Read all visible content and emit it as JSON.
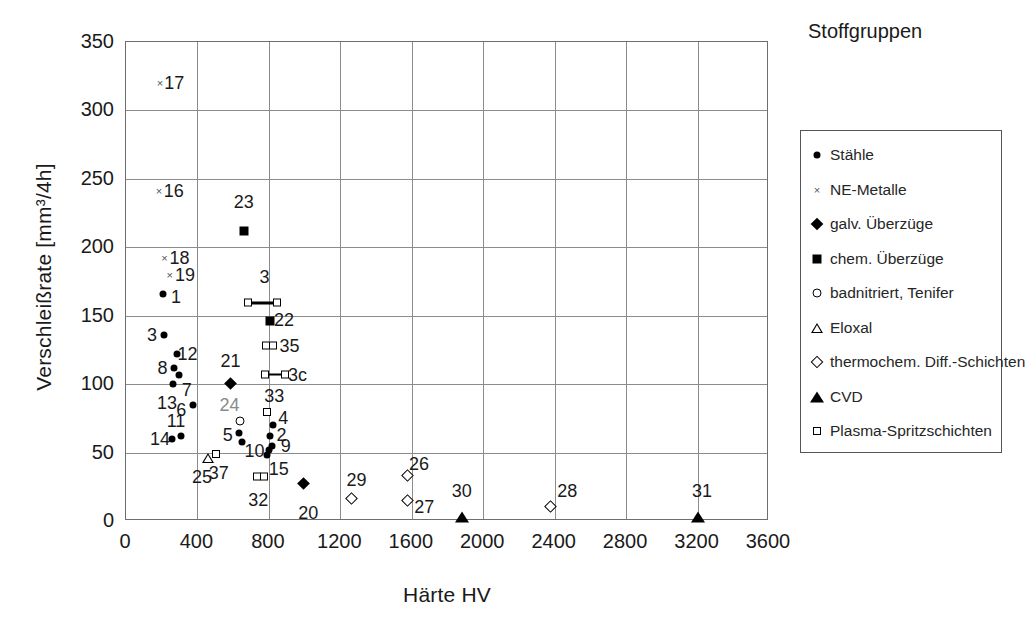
{
  "chart_data": {
    "type": "scatter",
    "title": "",
    "xlabel": "Härte HV",
    "ylabel": "Verschleißrate [mm³/4h]",
    "xlim": [
      0,
      3600
    ],
    "ylim": [
      0,
      350
    ],
    "xticks": [
      0,
      400,
      800,
      1200,
      1600,
      2000,
      2400,
      2800,
      3200,
      3600
    ],
    "yticks": [
      0,
      50,
      100,
      150,
      200,
      250,
      300,
      350
    ],
    "grid": true,
    "legend_title": "Stoffgruppen",
    "legend_position": "right",
    "series": [
      {
        "name": "Stähle",
        "marker": "circle-filled"
      },
      {
        "name": "NE-Metalle",
        "marker": "cross"
      },
      {
        "name": "galv. Überzüge",
        "marker": "diamond-filled"
      },
      {
        "name": "chem. Überzüge",
        "marker": "square-filled"
      },
      {
        "name": "badnitriert, Tenifer",
        "marker": "circle-open"
      },
      {
        "name": "Eloxal",
        "marker": "triangle-open"
      },
      {
        "name": "thermochem. Diff.-Schichten",
        "marker": "diamond-open"
      },
      {
        "name": "CVD",
        "marker": "triangle-filled"
      },
      {
        "name": "Plasma-Spritzschichten",
        "marker": "square-open"
      }
    ],
    "points": [
      {
        "label": "17",
        "series": "NE-Metalle",
        "x": 190,
        "y": 320,
        "lx": 270,
        "ly": 320
      },
      {
        "label": "16",
        "series": "NE-Metalle",
        "x": 185,
        "y": 241,
        "lx": 268,
        "ly": 241
      },
      {
        "label": "23",
        "series": "chem. Überzüge",
        "x": 660,
        "y": 212,
        "lx": 660,
        "ly": 233
      },
      {
        "label": "18",
        "series": "NE-Metalle",
        "x": 215,
        "y": 192,
        "lx": 300,
        "ly": 192
      },
      {
        "label": "19",
        "series": "NE-Metalle",
        "x": 245,
        "y": 180,
        "lx": 330,
        "ly": 180
      },
      {
        "label": "1",
        "series": "Stähle",
        "x": 205,
        "y": 166,
        "lx": 280,
        "ly": 164
      },
      {
        "label": "3",
        "series": "Plasma-Spritzschichten",
        "x": 765,
        "y": 159,
        "x0": 660,
        "x1": 870,
        "lx": 775,
        "ly": 178,
        "range": true
      },
      {
        "label": "22",
        "series": "chem. Überzüge",
        "x": 805,
        "y": 146,
        "lx": 885,
        "ly": 147
      },
      {
        "label": "3b",
        "series": "Stähle",
        "x": 215,
        "y": 136,
        "lx": 145,
        "ly": 136,
        "dl": "3"
      },
      {
        "label": "35",
        "series": "Plasma-Spritzschichten",
        "x": 800,
        "y": 128,
        "x0": 760,
        "x1": 845,
        "lx": 915,
        "ly": 128,
        "range": true
      },
      {
        "label": "12",
        "series": "Stähle",
        "x": 285,
        "y": 122,
        "lx": 345,
        "ly": 122
      },
      {
        "label": "3c",
        "series": "Plasma-Spritzschichten",
        "x": 830,
        "y": 107,
        "x0": 755,
        "x1": 915,
        "lx": 960,
        "ly": 107,
        "range": true
      },
      {
        "label": "8",
        "series": "Stähle",
        "x": 270,
        "y": 112,
        "lx": 205,
        "ly": 112
      },
      {
        "label": "7",
        "series": "Stähle",
        "x": 295,
        "y": 107,
        "lx": 340,
        "ly": 96
      },
      {
        "label": "21",
        "series": "galv. Überzüge",
        "x": 610,
        "y": 97,
        "lx": 585,
        "ly": 117
      },
      {
        "label": "13",
        "series": "Stähle",
        "x": 265,
        "y": 100,
        "lx": 230,
        "ly": 86
      },
      {
        "label": "6",
        "series": "Stähle",
        "x": 375,
        "y": 85,
        "lx": 310,
        "ly": 81
      },
      {
        "label": "24",
        "series": "badnitriert, Tenifer",
        "x": 640,
        "y": 73,
        "lx": 580,
        "ly": 85,
        "gray": true
      },
      {
        "label": "33",
        "series": "Plasma-Spritzschichten",
        "x": 790,
        "y": 80,
        "lx": 830,
        "ly": 91
      },
      {
        "label": "4",
        "series": "Stähle",
        "x": 825,
        "y": 70,
        "lx": 880,
        "ly": 75
      },
      {
        "label": "2",
        "series": "Stähle",
        "x": 805,
        "y": 62,
        "lx": 870,
        "ly": 63
      },
      {
        "label": "11",
        "series": "Stähle",
        "x": 310,
        "y": 62,
        "lx": 280,
        "ly": 73
      },
      {
        "label": "5",
        "series": "Stähle",
        "x": 635,
        "y": 64,
        "lx": 570,
        "ly": 63
      },
      {
        "label": "5b",
        "series": "Stähle",
        "x": 650,
        "y": 58,
        "lx": 0,
        "ly": 0,
        "nolabel": true
      },
      {
        "label": "14",
        "series": "Stähle",
        "x": 255,
        "y": 60,
        "lx": 190,
        "ly": 60
      },
      {
        "label": "9",
        "series": "Stähle",
        "x": 820,
        "y": 55,
        "lx": 895,
        "ly": 55
      },
      {
        "label": "10",
        "series": "Stähle",
        "x": 790,
        "y": 48,
        "lx": 720,
        "ly": 51
      },
      {
        "label": "37",
        "series": "Plasma-Spritzschichten",
        "x": 505,
        "y": 49,
        "lx": 520,
        "ly": 35
      },
      {
        "label": "25",
        "series": "Eloxal",
        "x": 460,
        "y": 46,
        "lx": 425,
        "ly": 32
      },
      {
        "label": "15",
        "series": "Stähle",
        "x": 800,
        "y": 52,
        "lx": 855,
        "ly": 38
      },
      {
        "label": "32",
        "series": "Plasma-Spritzschichten",
        "x": 755,
        "y": 32,
        "x0": 710,
        "x1": 795,
        "lx": 740,
        "ly": 15,
        "range": true
      },
      {
        "label": "20",
        "series": "galv. Überzüge",
        "x": 1020,
        "y": 24,
        "lx": 1020,
        "ly": 6
      },
      {
        "label": "29",
        "series": "thermochem. Diff.-Schichten",
        "x": 1290,
        "y": 13,
        "lx": 1290,
        "ly": 30
      },
      {
        "label": "26",
        "series": "thermochem. Diff.-Schichten",
        "x": 1600,
        "y": 30,
        "lx": 1640,
        "ly": 42
      },
      {
        "label": "27",
        "series": "thermochem. Diff.-Schichten",
        "x": 1600,
        "y": 12,
        "lx": 1670,
        "ly": 10
      },
      {
        "label": "30",
        "series": "CVD",
        "x": 1880,
        "y": 3,
        "lx": 1880,
        "ly": 22
      },
      {
        "label": "28",
        "series": "thermochem. Diff.-Schichten",
        "x": 2400,
        "y": 7,
        "lx": 2470,
        "ly": 22
      },
      {
        "label": "31",
        "series": "CVD",
        "x": 3200,
        "y": 3,
        "lx": 3225,
        "ly": 22
      }
    ]
  }
}
